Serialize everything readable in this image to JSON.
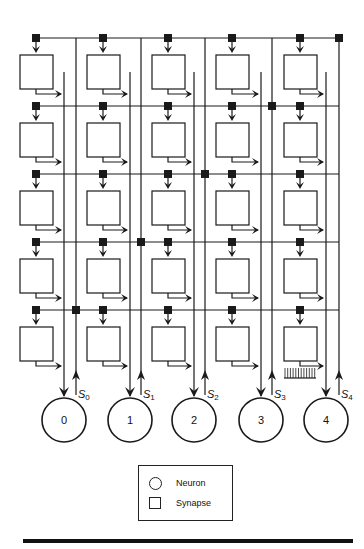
{
  "diagram": {
    "title": "",
    "rows": 5,
    "columns": 5,
    "neurons": [
      {
        "id": "0",
        "label": "0"
      },
      {
        "id": "1",
        "label": "1"
      },
      {
        "id": "2",
        "label": "2"
      },
      {
        "id": "3",
        "label": "3"
      },
      {
        "id": "4",
        "label": "4"
      }
    ],
    "feedback_lines": [
      {
        "name": "S",
        "sub": "0"
      },
      {
        "name": "S",
        "sub": "1"
      },
      {
        "name": "S",
        "sub": "2"
      },
      {
        "name": "S",
        "sub": "3"
      },
      {
        "name": "S",
        "sub": "4"
      }
    ],
    "colors": {
      "stroke": "#1a1a1a",
      "fill_synapse": "#111111",
      "background": "#ffffff"
    }
  },
  "legend": {
    "items": [
      {
        "shape": "circle",
        "label": "Neuron"
      },
      {
        "shape": "square",
        "label": "Synapse"
      }
    ]
  }
}
